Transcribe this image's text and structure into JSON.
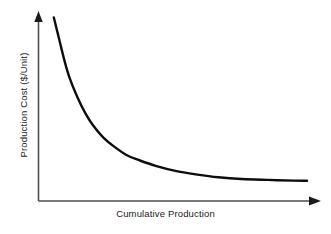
{
  "chart_data": {
    "type": "line",
    "title": "",
    "xlabel": "Cumulative Production",
    "ylabel": "Production Cost ($/Unit)",
    "grid": false,
    "legend": null,
    "axis_style": "arrow-axes",
    "xlim": [
      0,
      100
    ],
    "ylim": [
      0,
      100
    ],
    "xticks": [],
    "yticks": [],
    "series": [
      {
        "name": "Experience curve",
        "color": "#0d0d0d",
        "linewidth": 2.4,
        "x": [
          3,
          5,
          7,
          9,
          12,
          15,
          18,
          22,
          26,
          31,
          36,
          42,
          50,
          58,
          66,
          75,
          85,
          95,
          100
        ],
        "y": [
          98,
          86,
          74,
          64,
          53,
          44,
          37,
          30,
          25,
          20,
          17,
          14,
          11,
          9,
          7.5,
          6.5,
          6,
          5.6,
          5.5
        ]
      }
    ],
    "annotations": []
  },
  "axes": {
    "x_axis_name": "x-axis-arrow",
    "y_axis_name": "y-axis-arrow",
    "color": "#4d4d4d"
  },
  "labels": {
    "x": "Cumulative Production",
    "y": "Production Cost ($/Unit)"
  }
}
